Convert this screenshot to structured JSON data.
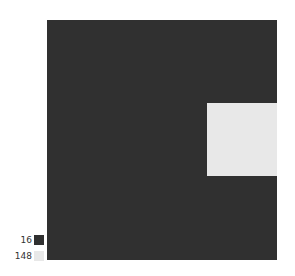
{
  "chart_data": {
    "type": "heatmap",
    "title": "",
    "xlabel": "",
    "ylabel": "",
    "grid": false,
    "legend_position": "bottom-left",
    "background_value": 16,
    "regions": [
      {
        "value": 16,
        "color": "#303030",
        "x": 0,
        "y": 0,
        "w": 230,
        "h": 240
      },
      {
        "value": 148,
        "color": "#e8e8e8",
        "x": 160,
        "y": 83,
        "w": 70,
        "h": 73
      }
    ],
    "legend": [
      {
        "label": "16",
        "value": 16,
        "color": "#303030"
      },
      {
        "label": "148",
        "value": 148,
        "color": "#e8e8e8"
      }
    ]
  },
  "legend": {
    "items": [
      {
        "label": "16",
        "color": "#303030"
      },
      {
        "label": "148",
        "color": "#e8e8e8"
      }
    ]
  }
}
